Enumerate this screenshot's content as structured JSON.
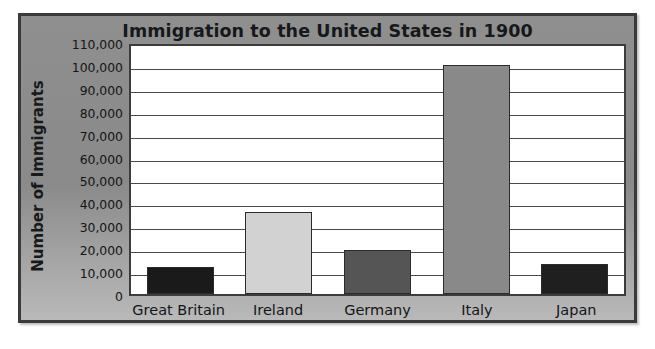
{
  "chart_data": {
    "type": "bar",
    "title": "Immigration to the United States in 1900",
    "xlabel": "",
    "ylabel": "Number of Immigrants",
    "categories": [
      "Great Britain",
      "Ireland",
      "Germany",
      "Italy",
      "Japan"
    ],
    "values": [
      12000,
      36000,
      19000,
      100000,
      13000
    ],
    "series": [
      {
        "name": "Number of Immigrants",
        "values": [
          12000,
          36000,
          19000,
          100000,
          13000
        ]
      }
    ],
    "bar_colors": [
      "#1a1a1a",
      "#d2d2d2",
      "#555555",
      "#898989",
      "#1f1f1f"
    ],
    "ylim": [
      0,
      110000
    ],
    "ytick_step": 10000,
    "ytick_labels": [
      "110,000",
      "100,000",
      "90,000",
      "80,000",
      "70,000",
      "60,000",
      "50,000",
      "40,000",
      "30,000",
      "20,000",
      "10,000",
      "0"
    ],
    "ytick_values": [
      110000,
      100000,
      90000,
      80000,
      70000,
      60000,
      50000,
      40000,
      30000,
      20000,
      10000,
      0
    ],
    "grid": true,
    "grid_orientation": "horizontal",
    "legend": false,
    "legend_position": "none",
    "plot_background": "#ffffff",
    "figure_background": "#8a8a8a",
    "border_color": "#3a3a3a"
  }
}
